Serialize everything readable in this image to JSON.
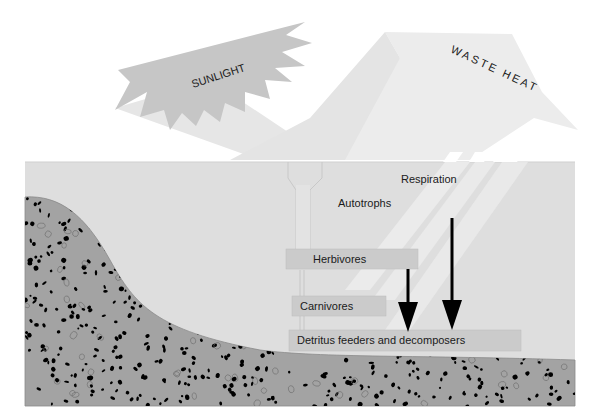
{
  "diagram": {
    "inputs": {
      "sunlight": {
        "label": "SUNLIGHT",
        "icon": "sunburst-arrow"
      },
      "waste_heat": {
        "label": "WASTE HEAT",
        "icon": "upward-arrow"
      }
    },
    "flows": {
      "respiration": {
        "label": "Respiration"
      }
    },
    "trophic_levels": [
      {
        "id": "autotrophs",
        "label": "Autotrophs"
      },
      {
        "id": "herbivores",
        "label": "Herbivores"
      },
      {
        "id": "carnivores",
        "label": "Carnivores"
      },
      {
        "id": "detritus",
        "label": "Detritus feeders and decomposers"
      }
    ],
    "colors": {
      "sunlight": "#c4c4c4",
      "waste_heat": "#e9e9e9",
      "water": "#dedede",
      "sediment": "#a3a3a3",
      "box": "#cdcdcd",
      "arrow": "#000000"
    }
  }
}
